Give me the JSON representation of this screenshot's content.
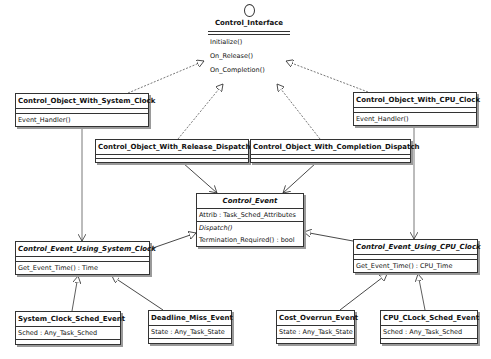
{
  "diagram": {
    "type": "UML class diagram",
    "interface": {
      "name": "Control_Interface",
      "stereotype_icon": "interface-lollipop-circle",
      "operations": [
        "Initialize()",
        "On_Release()",
        "On_Completion()"
      ]
    },
    "classes": [
      {
        "id": "cows",
        "name": "Control_Object_With_System_Clock",
        "abstract": false,
        "attributes": [],
        "operations": [
          "Event_Handler()"
        ]
      },
      {
        "id": "cowc",
        "name": "Control_Object_With_CPU_Clock",
        "abstract": false,
        "attributes": [],
        "operations": [
          "Event_Handler()"
        ]
      },
      {
        "id": "cowr",
        "name": "Control_Object_With_Release_Dispatch",
        "abstract": false,
        "attributes": [],
        "operations": []
      },
      {
        "id": "cowcd",
        "name": "Control_Object_With_Completion_Dispatch",
        "abstract": false,
        "attributes": [],
        "operations": []
      },
      {
        "id": "ce",
        "name": "Control_Event",
        "abstract": true,
        "attributes": [
          "Attrib : Task_Sched_Attributes"
        ],
        "operations": [
          "Dispatch()",
          "Termination_Required() : bool"
        ]
      },
      {
        "id": "ceus",
        "name": "Control_Event_Using_System_Clock",
        "abstract": true,
        "attributes": [],
        "operations": [
          "Get_Event_Time() : Time"
        ]
      },
      {
        "id": "ceuc",
        "name": "Control_Event_Using_CPU_Clock",
        "abstract": true,
        "attributes": [],
        "operations": [
          "Get_Event_Time() : CPU_Time"
        ]
      },
      {
        "id": "scse",
        "name": "System_Clock_Sched_Event",
        "abstract": false,
        "attributes": [
          "Sched : Any_Task_Sched"
        ],
        "operations": []
      },
      {
        "id": "dme",
        "name": "Deadline_Miss_Event",
        "abstract": false,
        "attributes": [
          "State : Any_Task_State"
        ],
        "operations": []
      },
      {
        "id": "coe",
        "name": "Cost_Overrun_Event",
        "abstract": false,
        "attributes": [
          "State : Any_Task_State"
        ],
        "operations": []
      },
      {
        "id": "ccse",
        "name": "CPU_CLock_Sched_Event",
        "abstract": false,
        "attributes": [
          "Sched : Any_Task_Sched"
        ],
        "operations": []
      }
    ],
    "relations": [
      {
        "from": "Control_Object_With_System_Clock",
        "to": "Control_Interface",
        "kind": "realization"
      },
      {
        "from": "Control_Object_With_CPU_Clock",
        "to": "Control_Interface",
        "kind": "realization"
      },
      {
        "from": "Control_Object_With_Release_Dispatch",
        "to": "Control_Interface",
        "kind": "realization"
      },
      {
        "from": "Control_Object_With_Completion_Dispatch",
        "to": "Control_Interface",
        "kind": "realization"
      },
      {
        "from": "Control_Object_With_System_Clock",
        "to": "Control_Event_Using_System_Clock",
        "kind": "association"
      },
      {
        "from": "Control_Object_With_CPU_Clock",
        "to": "Control_Event_Using_CPU_Clock",
        "kind": "association"
      },
      {
        "from": "Control_Object_With_Release_Dispatch",
        "to": "Control_Event",
        "kind": "association"
      },
      {
        "from": "Control_Object_With_Completion_Dispatch",
        "to": "Control_Event",
        "kind": "association"
      },
      {
        "from": "Control_Event_Using_System_Clock",
        "to": "Control_Event",
        "kind": "generalization"
      },
      {
        "from": "Control_Event_Using_CPU_Clock",
        "to": "Control_Event",
        "kind": "generalization"
      },
      {
        "from": "System_Clock_Sched_Event",
        "to": "Control_Event_Using_System_Clock",
        "kind": "generalization"
      },
      {
        "from": "Deadline_Miss_Event",
        "to": "Control_Event_Using_System_Clock",
        "kind": "generalization"
      },
      {
        "from": "Cost_Overrun_Event",
        "to": "Control_Event_Using_CPU_Clock",
        "kind": "generalization"
      },
      {
        "from": "CPU_CLock_Sched_Event",
        "to": "Control_Event_Using_CPU_Clock",
        "kind": "generalization"
      }
    ]
  }
}
